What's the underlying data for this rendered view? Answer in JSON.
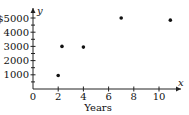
{
  "chart_data": {
    "type": "scatter",
    "title": "",
    "xlabel": "Years",
    "ylabel": "",
    "x_axis_var": "x",
    "y_axis_var": "y",
    "xlim": [
      0,
      11.5
    ],
    "ylim": [
      0,
      5300
    ],
    "x_ticks": [
      0,
      2,
      4,
      6,
      8,
      10
    ],
    "x_tick_labels": [
      "0",
      "2",
      "4",
      "6",
      "8",
      "10"
    ],
    "y_ticks": [
      1000,
      2000,
      3000,
      4000,
      5000
    ],
    "y_tick_labels": [
      "1000",
      "2000",
      "3000",
      "4000",
      "$5000"
    ],
    "y_minor_ticks": [
      500,
      1500,
      2500,
      3500,
      4500
    ],
    "x_minor_ticks": [
      1,
      3,
      5,
      7,
      9,
      11
    ],
    "grid": false,
    "legend": null,
    "points": [
      {
        "x": 2,
        "y": 950
      },
      {
        "x": 2.3,
        "y": 3000
      },
      {
        "x": 4,
        "y": 2950
      },
      {
        "x": 7,
        "y": 5000
      },
      {
        "x": 10.9,
        "y": 4850
      }
    ]
  }
}
